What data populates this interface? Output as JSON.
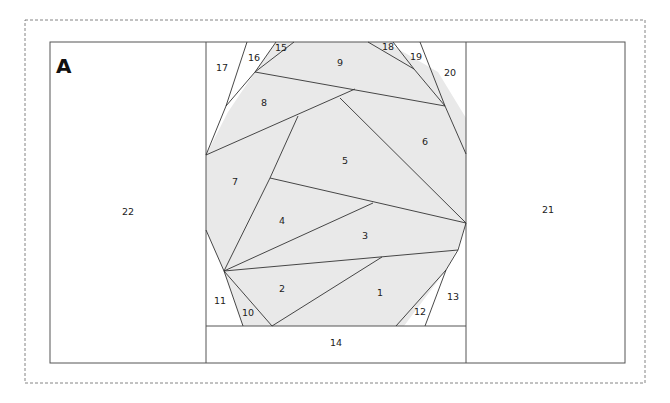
{
  "pattern": {
    "section_label": "A",
    "colors": {
      "fill_shaded": "#e9e9e9",
      "fill_background": "#ffffff",
      "line": "#333333",
      "dashed_border": "#777777"
    },
    "pieces": [
      {
        "id": "1",
        "label": "1",
        "shaded": true
      },
      {
        "id": "2",
        "label": "2",
        "shaded": true
      },
      {
        "id": "3",
        "label": "3",
        "shaded": true
      },
      {
        "id": "4",
        "label": "4",
        "shaded": true
      },
      {
        "id": "5",
        "label": "5",
        "shaded": true
      },
      {
        "id": "6",
        "label": "6",
        "shaded": true
      },
      {
        "id": "7",
        "label": "7",
        "shaded": true
      },
      {
        "id": "8",
        "label": "8",
        "shaded": true
      },
      {
        "id": "9",
        "label": "9",
        "shaded": true
      },
      {
        "id": "10",
        "label": "10",
        "shaded": false
      },
      {
        "id": "11",
        "label": "11",
        "shaded": false
      },
      {
        "id": "12",
        "label": "12",
        "shaded": false
      },
      {
        "id": "13",
        "label": "13",
        "shaded": false
      },
      {
        "id": "14",
        "label": "14",
        "shaded": false
      },
      {
        "id": "15",
        "label": "15",
        "shaded": false
      },
      {
        "id": "16",
        "label": "16",
        "shaded": false
      },
      {
        "id": "17",
        "label": "17",
        "shaded": false
      },
      {
        "id": "18",
        "label": "18",
        "shaded": false
      },
      {
        "id": "19",
        "label": "19",
        "shaded": false
      },
      {
        "id": "20",
        "label": "20",
        "shaded": false
      },
      {
        "id": "21",
        "label": "21",
        "shaded": false
      },
      {
        "id": "22",
        "label": "22",
        "shaded": false
      }
    ]
  }
}
